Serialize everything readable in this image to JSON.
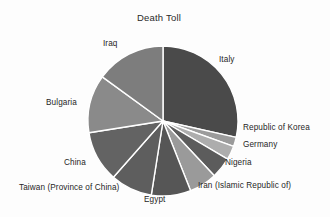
{
  "chart_data": {
    "type": "pie",
    "title": "Death Toll",
    "xlabel": "",
    "ylabel": "",
    "legend_position": "none",
    "labels_outside": true,
    "start_angle_deg": 0,
    "direction": "clockwise",
    "categories": [
      "Italy",
      "Republic of Korea",
      "Germany",
      "Nigeria",
      "Iran  (Islamic Republic of)",
      "Egypt",
      "Taiwan (Province of China)",
      "China",
      "Bulgaria",
      "Iraq"
    ],
    "values": [
      28.5,
      2.0,
      3.0,
      4.5,
      6.0,
      8.5,
      9.0,
      11.0,
      12.5,
      15.0
    ],
    "units": "percent",
    "colors": [
      "#4a4a4a",
      "#9b9b9b",
      "#adadad",
      "#5c5c5c",
      "#9a9a9a",
      "#565656",
      "#5e5e5e",
      "#636363",
      "#8a8a8a",
      "#7d7d7d"
    ],
    "slice_edge_color": "#ffffff"
  },
  "labels": {
    "italy": "Italy",
    "korea": "Republic of Korea",
    "germany": "Germany",
    "nigeria": "Nigeria",
    "iran": "Iran  (Islamic Republic of)",
    "egypt": "Egypt",
    "taiwan": "Taiwan (Province of China)",
    "china": "China",
    "bulgaria": "Bulgaria",
    "iraq": "Iraq"
  }
}
